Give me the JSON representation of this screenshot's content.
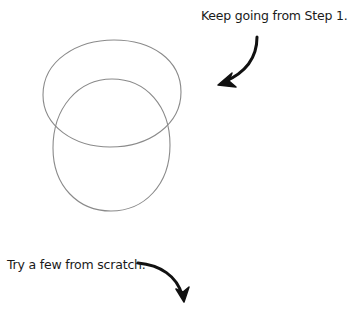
{
  "instructions": {
    "step1_prompt": "Keep going from Step 1.",
    "scratch_prompt": "Try a few from scratch."
  },
  "drawing": {
    "shapes": [
      {
        "type": "oval",
        "name": "top-oval",
        "cx": 112,
        "cy": 93,
        "rx": 69,
        "ry": 53
      },
      {
        "type": "oval",
        "name": "bottom-oval",
        "cx": 111,
        "cy": 145,
        "rx": 59,
        "ry": 66
      }
    ],
    "stroke_color": "#8a8a8a",
    "arrow_color": "#111111"
  }
}
